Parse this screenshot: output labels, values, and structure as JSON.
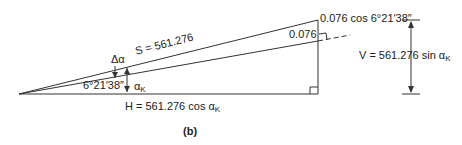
{
  "diagram": {
    "caption": "(b)",
    "slope_label": "S = 561.276",
    "angle_label": "6°21′38″",
    "delta_alpha": "Δα",
    "alpha_k": "α",
    "alpha_k_sub": "K",
    "horizontal_label": "H = 561.276 cos α",
    "horizontal_sub": "K",
    "vertical_label": "V = 561.276 sin α",
    "vertical_sub": "K",
    "offset_label": "0.076",
    "offset_cos_label": "0.076 cos 6°21′38″"
  }
}
